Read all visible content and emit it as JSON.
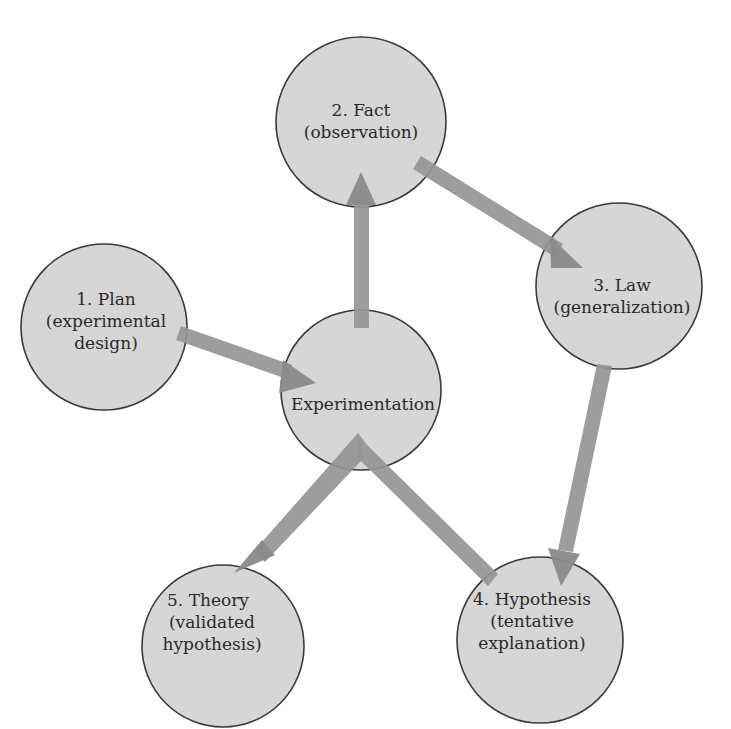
{
  "diagram": {
    "colors": {
      "circle_fill": "#d6d6d6",
      "circle_stroke": "#3a3a3a",
      "arrow": "#959595",
      "background": "#ffffff"
    },
    "nodes": {
      "fact": {
        "line1": "2.  Fact",
        "line2": "(observation)"
      },
      "plan": {
        "line1": "1.  Plan",
        "line2": "(experimental",
        "line3": "design)"
      },
      "law": {
        "line1": "3.  Law",
        "line2": "(generalization)"
      },
      "experimentation": {
        "line1": "Experimentation"
      },
      "theory": {
        "line1": "5.  Theory",
        "line2": "(validated",
        "line3": "hypothesis)"
      },
      "hypothesis": {
        "line1": "4.  Hypothesis",
        "line2": "(tentative",
        "line3": "explanation)"
      }
    },
    "edges": [
      {
        "from": "plan",
        "to": "experimentation"
      },
      {
        "from": "experimentation",
        "to": "fact"
      },
      {
        "from": "fact",
        "to": "law"
      },
      {
        "from": "law",
        "to": "hypothesis"
      },
      {
        "from": "hypothesis",
        "to": "experimentation"
      },
      {
        "from": "experimentation",
        "to": "theory"
      }
    ]
  }
}
